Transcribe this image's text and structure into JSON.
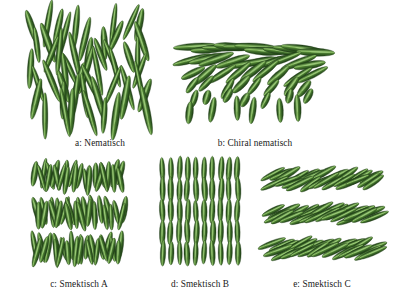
{
  "figure": {
    "background_color": "#ffffff",
    "caption_color": "#1a1a1a",
    "rod_colors": {
      "edge_dark": "#2d5520",
      "body_mid": "#4a7c2f",
      "highlight": "#8fc169",
      "shadow": "#1f3d16"
    }
  },
  "panels": [
    {
      "id": "a",
      "caption": "a: Nematisch",
      "phase": "nematic",
      "description": "rods with long-range orientational order, no positional order",
      "rod_count": 66,
      "mean_tilt_deg": 90,
      "tilt_spread_deg": 25
    },
    {
      "id": "b",
      "caption": "b: Chiral nematisch",
      "phase": "chiral-nematic",
      "description": "helically twisted director, rods rotate layer by layer",
      "rod_count": 62,
      "mean_tilt_deg": 0,
      "tilt_spread_deg": 90
    },
    {
      "id": "c",
      "caption": "c: Smektisch A",
      "phase": "smectic-A",
      "description": "layered, director perpendicular to layer planes",
      "rod_count": 75,
      "layers": 3,
      "mean_tilt_deg": 90,
      "tilt_spread_deg": 18
    },
    {
      "id": "d",
      "caption": "d: Smektisch B",
      "phase": "smectic-B",
      "description": "layered hexatic lattice, rods upright in ordered columns",
      "rod_count": 88,
      "layers": 4,
      "mean_tilt_deg": 90,
      "tilt_spread_deg": 4
    },
    {
      "id": "e",
      "caption": "e: Smektisch C",
      "phase": "smectic-C",
      "description": "layered, director tilted with respect to layer normal",
      "rod_count": 78,
      "layers": 3,
      "mean_tilt_deg": 28,
      "tilt_spread_deg": 10
    }
  ],
  "captions": {
    "a": "a: Nematisch",
    "b": "b: Chiral nematisch",
    "c": "c: Smektisch A",
    "d": "d: Smektisch B",
    "e": "e: Smektisch C"
  }
}
